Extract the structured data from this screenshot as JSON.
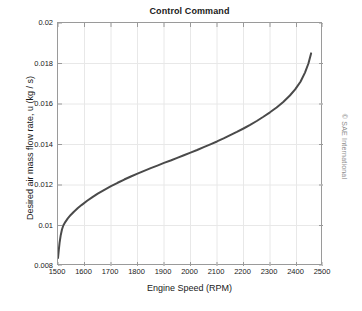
{
  "chart_data": {
    "type": "line",
    "title": "Control Command",
    "xlabel": "Engine Speed (RPM)",
    "ylabel": "Desired air mass flow rate, u (kg / s)",
    "xlim": [
      1500,
      2500
    ],
    "ylim": [
      0.008,
      0.02
    ],
    "grid": true,
    "legend": null,
    "xticks": [
      1500,
      1600,
      1700,
      1800,
      1900,
      2000,
      2100,
      2200,
      2300,
      2400,
      2500
    ],
    "xtick_labels": [
      "1500",
      "1600",
      "1700",
      "1800",
      "1900",
      "2000",
      "2100",
      "2200",
      "2300",
      "2400",
      "2500"
    ],
    "yticks": [
      0.008,
      0.01,
      0.012,
      0.014,
      0.016,
      0.018,
      0.02
    ],
    "ytick_labels": [
      "0.008",
      "0.01",
      "0.012",
      "0.014",
      "0.016",
      "0.018",
      "0.02"
    ],
    "line_color": "#4a4a4a",
    "line_width": 2,
    "series": [
      {
        "name": "Desired air mass flow rate",
        "x": [
          1500,
          1503,
          1506,
          1510,
          1515,
          1520,
          1528,
          1537,
          1548,
          1560,
          1575,
          1590,
          1610,
          1630,
          1650,
          1675,
          1700,
          1725,
          1750,
          1775,
          1800,
          1825,
          1850,
          1875,
          1900,
          1925,
          1950,
          1975,
          2000,
          2025,
          2050,
          2075,
          2100,
          2125,
          2150,
          2175,
          2200,
          2225,
          2250,
          2275,
          2300,
          2325,
          2350,
          2375,
          2395,
          2415,
          2432,
          2445,
          2455
        ],
        "y": [
          0.0084,
          0.0088,
          0.00915,
          0.0095,
          0.0098,
          0.01,
          0.01018,
          0.01035,
          0.01052,
          0.01068,
          0.01086,
          0.01102,
          0.01122,
          0.0114,
          0.01157,
          0.01176,
          0.01194,
          0.01211,
          0.01227,
          0.01242,
          0.01256,
          0.0127,
          0.01283,
          0.01296,
          0.01309,
          0.01321,
          0.01334,
          0.01347,
          0.0136,
          0.01373,
          0.01387,
          0.01401,
          0.01415,
          0.0143,
          0.01446,
          0.01462,
          0.01479,
          0.01497,
          0.01516,
          0.01537,
          0.01559,
          0.01583,
          0.0161,
          0.01642,
          0.01672,
          0.0171,
          0.01755,
          0.018,
          0.0185
        ]
      }
    ]
  },
  "attribution": {
    "text": "© SAE International"
  }
}
